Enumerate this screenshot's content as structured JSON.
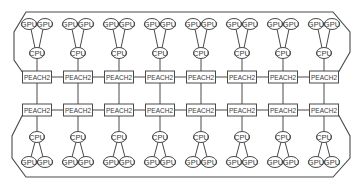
{
  "diagram": {
    "labels": {
      "gpu": "GPU",
      "cpu": "CPU",
      "switch": "PEACH2"
    },
    "layout": {
      "columns": 8,
      "column_centers_x": [
        37,
        78,
        119,
        160,
        201,
        242,
        283,
        324
      ],
      "top_row": {
        "gpu_y": 24,
        "cpu_y": 53,
        "peach_y": 77
      },
      "bottom_row": {
        "peach_y": 110,
        "cpu_y": 137,
        "gpu_y": 162
      },
      "gpu_offset_x": 8,
      "ring_color": "#4a4a4a"
    },
    "top_nodes": [
      {
        "id": "T1",
        "gpus": [
          "GPU",
          "GPU"
        ],
        "cpu": "CPU",
        "switch": "PEACH2"
      },
      {
        "id": "T2",
        "gpus": [
          "GPU",
          "GPU"
        ],
        "cpu": "CPU",
        "switch": "PEACH2"
      },
      {
        "id": "T3",
        "gpus": [
          "GPU",
          "GPU"
        ],
        "cpu": "CPU",
        "switch": "PEACH2"
      },
      {
        "id": "T4",
        "gpus": [
          "GPU",
          "GPU"
        ],
        "cpu": "CPU",
        "switch": "PEACH2"
      },
      {
        "id": "T5",
        "gpus": [
          "GPU",
          "GPU"
        ],
        "cpu": "CPU",
        "switch": "PEACH2"
      },
      {
        "id": "T6",
        "gpus": [
          "GPU",
          "GPU"
        ],
        "cpu": "CPU",
        "switch": "PEACH2"
      },
      {
        "id": "T7",
        "gpus": [
          "GPU",
          "GPU"
        ],
        "cpu": "CPU",
        "switch": "PEACH2"
      },
      {
        "id": "T8",
        "gpus": [
          "GPU",
          "GPU"
        ],
        "cpu": "CPU",
        "switch": "PEACH2"
      }
    ],
    "bottom_nodes": [
      {
        "id": "B1",
        "gpus": [
          "GPU",
          "GPU"
        ],
        "cpu": "CPU",
        "switch": "PEACH2"
      },
      {
        "id": "B2",
        "gpus": [
          "GPU",
          "GPU"
        ],
        "cpu": "CPU",
        "switch": "PEACH2"
      },
      {
        "id": "B3",
        "gpus": [
          "GPU",
          "GPU"
        ],
        "cpu": "CPU",
        "switch": "PEACH2"
      },
      {
        "id": "B4",
        "gpus": [
          "GPU",
          "GPU"
        ],
        "cpu": "CPU",
        "switch": "PEACH2"
      },
      {
        "id": "B5",
        "gpus": [
          "GPU",
          "GPU"
        ],
        "cpu": "CPU",
        "switch": "PEACH2"
      },
      {
        "id": "B6",
        "gpus": [
          "GPU",
          "GPU"
        ],
        "cpu": "CPU",
        "switch": "PEACH2"
      },
      {
        "id": "B7",
        "gpus": [
          "GPU",
          "GPU"
        ],
        "cpu": "CPU",
        "switch": "PEACH2"
      },
      {
        "id": "B8",
        "gpus": [
          "GPU",
          "GPU"
        ],
        "cpu": "CPU",
        "switch": "PEACH2"
      }
    ]
  }
}
